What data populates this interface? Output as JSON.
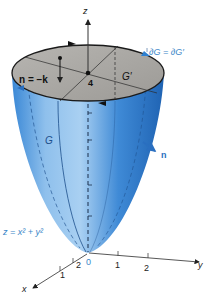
{
  "figure": {
    "type": "3D paraboloid surface with cap disc",
    "labels": {
      "z_axis": "z",
      "x_axis": "x",
      "y_axis": "y",
      "normal_top": "n = −k",
      "normal_side": "n",
      "height_value": "4",
      "disc_label": "G′",
      "surface_label": "G",
      "boundary_equation": "∂G = ∂G′",
      "surface_equation": "z = x² + y²",
      "origin": "0"
    },
    "x_ticks": [
      "2",
      "1"
    ],
    "y_ticks": [
      "1",
      "2"
    ],
    "colors": {
      "surface_blue": "#2f7fd1",
      "surface_light": "#9cc8ee",
      "surface_dark": "#1d5fae",
      "disc_gray": "#a9a7a3",
      "label_blue": "#3a86c8",
      "axis": "#333333"
    }
  }
}
